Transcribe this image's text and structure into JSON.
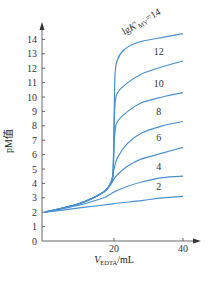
{
  "chart_data": {
    "type": "line",
    "title": "",
    "xlabel": "V_EDTA/mL",
    "xlabel_main": "V",
    "xlabel_sub": "EDTA",
    "xlabel_unit": "/mL",
    "ylabel": "pM值",
    "xlim": [
      0,
      45
    ],
    "ylim": [
      0,
      15
    ],
    "x_ticks": [
      20,
      40
    ],
    "y_ticks": [
      0,
      1,
      2,
      3,
      4,
      5,
      6,
      7,
      8,
      9,
      10,
      11,
      12,
      13,
      14
    ],
    "grid": false,
    "legend": "inline labels on curves",
    "curve_label_prefix": "lgK′MY=",
    "colors": {
      "curve": "#4a90d0",
      "axis": "#666666"
    },
    "series": [
      {
        "name": "lgK′MY=14",
        "label": "14",
        "x": [
          0,
          10,
          17,
          19,
          19.7,
          20,
          20.3,
          21,
          23,
          27,
          33,
          40
        ],
        "y": [
          2,
          2.6,
          3.4,
          4.0,
          4.6,
          8.0,
          11.5,
          12.6,
          13.3,
          13.8,
          14.1,
          14.4
        ]
      },
      {
        "name": "lgK′MY=12",
        "label": "12",
        "x": [
          0,
          10,
          17,
          19,
          19.7,
          20,
          20.3,
          21,
          24,
          28,
          34,
          40
        ],
        "y": [
          2,
          2.6,
          3.4,
          4.0,
          4.6,
          7.5,
          9.5,
          10.3,
          11.0,
          11.6,
          12.1,
          12.5
        ]
      },
      {
        "name": "lgK′MY=10",
        "label": "10",
        "x": [
          0,
          10,
          17,
          19,
          19.7,
          20,
          20.3,
          21,
          24,
          28,
          34,
          40
        ],
        "y": [
          2,
          2.6,
          3.4,
          4.0,
          4.6,
          6.5,
          7.6,
          8.3,
          9.0,
          9.6,
          10.0,
          10.3
        ]
      },
      {
        "name": "lgK′MY=8",
        "label": "8",
        "x": [
          0,
          10,
          17,
          19,
          20,
          21,
          24,
          28,
          34,
          40
        ],
        "y": [
          2,
          2.6,
          3.4,
          4.0,
          5.0,
          5.8,
          6.8,
          7.5,
          8.0,
          8.3
        ]
      },
      {
        "name": "lgK′MY=6",
        "label": "6",
        "x": [
          0,
          10,
          17,
          19,
          20,
          21,
          24,
          28,
          34,
          40
        ],
        "y": [
          2,
          2.6,
          3.4,
          3.9,
          4.3,
          4.6,
          5.2,
          5.7,
          6.1,
          6.5
        ]
      },
      {
        "name": "lgK′MY=4",
        "label": "4",
        "x": [
          0,
          10,
          17,
          20,
          24,
          28,
          34,
          40
        ],
        "y": [
          2,
          2.5,
          3.0,
          3.4,
          3.8,
          4.1,
          4.4,
          4.5
        ]
      },
      {
        "name": "lgK′MY=2",
        "label": "2",
        "x": [
          0,
          10,
          17,
          20,
          28,
          34,
          40
        ],
        "y": [
          2,
          2.3,
          2.5,
          2.6,
          2.8,
          3.0,
          3.1
        ]
      }
    ]
  }
}
